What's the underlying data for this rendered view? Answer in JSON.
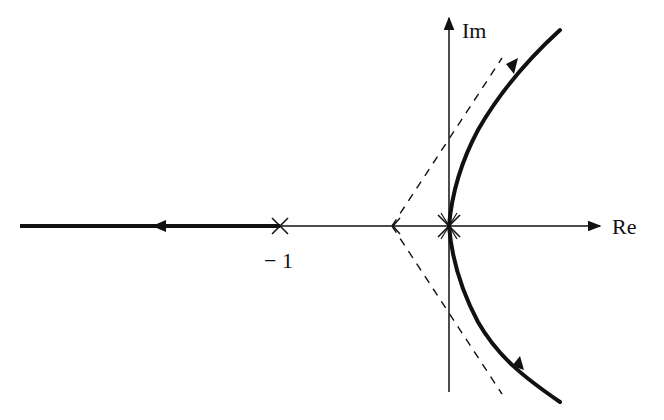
{
  "diagram": {
    "type": "root-locus",
    "axes": {
      "real_label": "Re",
      "imag_label": "Im"
    },
    "poles": [
      {
        "label": "-1",
        "value": -1,
        "marker": "x-icon"
      },
      {
        "label": "",
        "value": 0,
        "marker": "x-icon",
        "multiplicity": 2
      }
    ],
    "tick_labels": {
      "minus_one": "− 1"
    },
    "branches": [
      {
        "name": "real-axis-branch",
        "from": "-1",
        "to": "-infinity",
        "style": "thick solid",
        "direction": "left"
      },
      {
        "name": "upper-branch",
        "from": "0",
        "to": "upper asymptote",
        "style": "thick solid curve"
      },
      {
        "name": "lower-branch",
        "from": "0",
        "to": "lower asymptote",
        "style": "thick solid curve"
      }
    ],
    "asymptotes": [
      {
        "name": "upper-asymptote",
        "style": "dashed",
        "angle_deg": 60
      },
      {
        "name": "lower-asymptote",
        "style": "dashed",
        "angle_deg": -60
      }
    ],
    "colors": {
      "ink": "#111111",
      "background": "#ffffff"
    }
  }
}
